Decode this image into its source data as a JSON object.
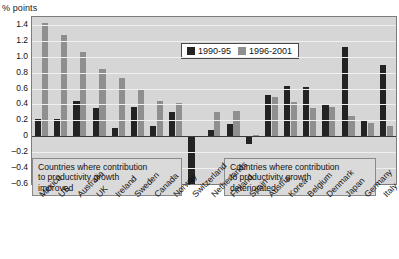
{
  "axis": {
    "unit_label": "% points",
    "yticks": [
      "1.4",
      "1.2",
      "1.0",
      "0.8",
      "0.6",
      "0.4",
      "0.2",
      "0",
      "-0.2",
      "-0.4",
      "-0.6"
    ]
  },
  "legend": {
    "series1_label": "1990-95",
    "series2_label": "1996-2001",
    "series1_color": "#232323",
    "series2_color": "#8f8f8f"
  },
  "annotations": {
    "left": "Countries where contribution\nto productivity growth\nimproved",
    "right": "Countries where contribution\nto productivity growth\ndeteriorated"
  },
  "chart_data": {
    "type": "bar",
    "title": "",
    "subtitle": "",
    "xlabel": "",
    "ylabel": "% points",
    "ylim": [
      -0.6,
      1.5
    ],
    "ytick_step": 0.2,
    "grid": true,
    "legend_position": "top-center",
    "categories": [
      "Mexico",
      "US",
      "Australia",
      "UK",
      "Ireland",
      "Sweden",
      "Canada",
      "Norway",
      "Switzerland",
      "Netherlands",
      "Finland",
      "Spain",
      "Austria",
      "Korea",
      "Belgium",
      "Denmark",
      "Japan",
      "Germany",
      "Italy"
    ],
    "series": [
      {
        "name": "1990-95",
        "color": "#232323",
        "values": [
          0.22,
          0.22,
          0.45,
          0.36,
          0.1,
          0.37,
          0.13,
          0.3,
          -0.6,
          0.08,
          0.16,
          -0.1,
          0.52,
          0.63,
          0.62,
          0.4,
          1.12,
          0.2,
          0.9
        ]
      },
      {
        "name": "1996-2001",
        "color": "#8f8f8f",
        "values": [
          1.42,
          1.28,
          1.06,
          0.85,
          0.73,
          0.59,
          0.45,
          0.42,
          0.0,
          0.3,
          0.32,
          0.02,
          0.5,
          0.43,
          0.36,
          0.37,
          0.25,
          0.17,
          0.13
        ]
      }
    ],
    "annotations": [
      "Countries where contribution to productivity growth improved",
      "Countries where contribution to productivity growth deteriorated"
    ]
  }
}
